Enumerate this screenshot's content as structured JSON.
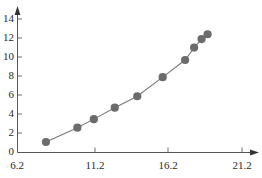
{
  "chart_data": {
    "type": "line",
    "title": "",
    "subtitle": "",
    "xlabel": "",
    "ylabel": "",
    "xlim": [
      6.2,
      21.2
    ],
    "ylim": [
      0,
      15
    ],
    "grid": false,
    "legend": null,
    "marker": "circle",
    "series": [
      {
        "name": "series-1",
        "color": "#6b6b6b",
        "x": [
          8.1,
          10.2,
          11.3,
          12.7,
          14.2,
          15.9,
          17.4,
          18.0,
          18.5,
          18.9
        ],
        "y": [
          1.1,
          2.6,
          3.5,
          4.7,
          5.9,
          7.9,
          9.7,
          11.0,
          11.9,
          12.4
        ],
        "points": [
          {
            "x": 8.1,
            "y": 1.1
          },
          {
            "x": 10.2,
            "y": 2.6
          },
          {
            "x": 11.3,
            "y": 3.5
          },
          {
            "x": 12.7,
            "y": 4.7
          },
          {
            "x": 14.2,
            "y": 5.9
          },
          {
            "x": 15.9,
            "y": 7.9
          },
          {
            "x": 17.4,
            "y": 9.7
          },
          {
            "x": 18.0,
            "y": 11.0
          },
          {
            "x": 18.5,
            "y": 11.9
          },
          {
            "x": 18.9,
            "y": 12.4
          }
        ]
      }
    ],
    "xticks": [
      6.2,
      11.2,
      16.2,
      21.2
    ],
    "xtick_labels": [
      "6.2",
      "11.2",
      "16.2",
      "21.2"
    ],
    "yticks": [
      0,
      2,
      4,
      6,
      8,
      10,
      12,
      14
    ],
    "ytick_labels": [
      "0",
      "2",
      "4",
      "6",
      "8",
      "10",
      "12",
      "14"
    ]
  },
  "axes": {
    "y_labels": {
      "t14": "14",
      "t12": "12",
      "t10": "10",
      "t8": "8",
      "t6": "6",
      "t4": "4",
      "t2": "2",
      "t0": "0"
    },
    "x_labels": {
      "t0": "6.2",
      "t1": "11.2",
      "t2": "16.2",
      "t3": "21.2"
    }
  },
  "colors": {
    "marker": "#6b6b6b",
    "line": "#7a7a7a",
    "axis": "#555555",
    "text": "#2b2b2b"
  }
}
